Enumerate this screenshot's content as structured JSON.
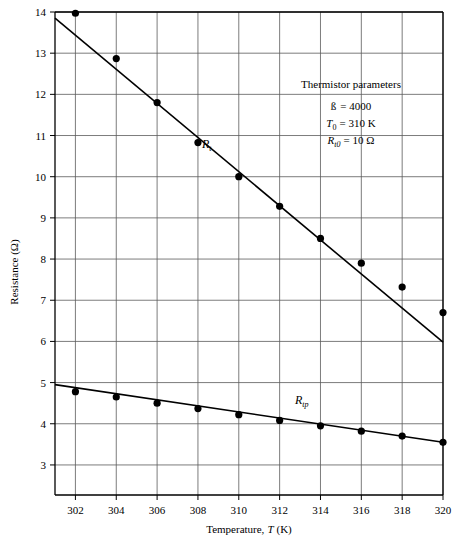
{
  "chart_data": {
    "type": "scatter",
    "title": "",
    "xlabel": "Temperature, T (K)",
    "ylabel": "Resistance (Ω)",
    "xlim": [
      301,
      320
    ],
    "ylim": [
      2.27,
      14
    ],
    "grid": true,
    "legend_position": "inline-labels",
    "x_ticks": [
      302,
      304,
      306,
      308,
      310,
      312,
      314,
      316,
      318,
      320
    ],
    "y_ticks": [
      3,
      4,
      5,
      6,
      7,
      8,
      9,
      10,
      11,
      12,
      13,
      14
    ],
    "x": [
      302,
      304,
      306,
      308,
      310,
      312,
      314,
      316,
      318,
      320
    ],
    "series": [
      {
        "name": "R_t",
        "label": "R",
        "label_sub": "t",
        "values": [
          13.97,
          12.87,
          11.8,
          10.83,
          10.0,
          9.28,
          8.5,
          7.9,
          7.32,
          6.7
        ],
        "fit_line": {
          "x": [
            301,
            320
          ],
          "y": [
            13.85,
            5.98
          ]
        }
      },
      {
        "name": "R_tp",
        "label": "R",
        "label_sub": "tp",
        "values": [
          4.78,
          4.65,
          4.5,
          4.37,
          4.22,
          4.08,
          3.95,
          3.82,
          3.7,
          3.55
        ],
        "fit_line": {
          "x": [
            301,
            320
          ],
          "y": [
            4.95,
            3.55
          ]
        }
      }
    ],
    "annotation": {
      "title": "Thermistor parameters",
      "lines": [
        {
          "symbol": "ß",
          "sub": "",
          "value": "= 4000"
        },
        {
          "symbol": "T",
          "sub": "0",
          "value": "= 310 K"
        },
        {
          "symbol": "R",
          "sub": "t0",
          "value": "= 10 Ω"
        }
      ]
    }
  },
  "axes": {
    "x_tick_labels": [
      "302",
      "304",
      "306",
      "308",
      "310",
      "312",
      "314",
      "316",
      "318",
      "320"
    ],
    "y_tick_labels": [
      "3",
      "4",
      "5",
      "6",
      "7",
      "8",
      "9",
      "10",
      "11",
      "12",
      "13",
      "14"
    ],
    "x_title": "Temperature, T (K)",
    "x_title_prefix": "Temperature,",
    "x_title_symbol": "T",
    "x_title_unit": "(K)",
    "y_title": "Resistance (Ω)"
  },
  "labels": {
    "series_rt": "R",
    "series_rt_sub": "t",
    "series_rtp": "R",
    "series_rtp_sub": "tp"
  },
  "annotation": {
    "title": "Thermistor parameters",
    "beta_symbol": "ß",
    "beta_value": "= 4000",
    "t0_symbol": "T",
    "t0_sub": "0",
    "t0_value": "= 310 K",
    "rt0_symbol": "R",
    "rt0_sub": "t0",
    "rt0_value": "= 10 Ω"
  }
}
